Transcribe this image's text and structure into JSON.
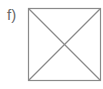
{
  "figure": {
    "label": "f)",
    "shape": "square-with-diagonals",
    "stroke_color": "#8a8a8a",
    "square": {
      "x": 28,
      "y": 8,
      "size": 72
    }
  }
}
